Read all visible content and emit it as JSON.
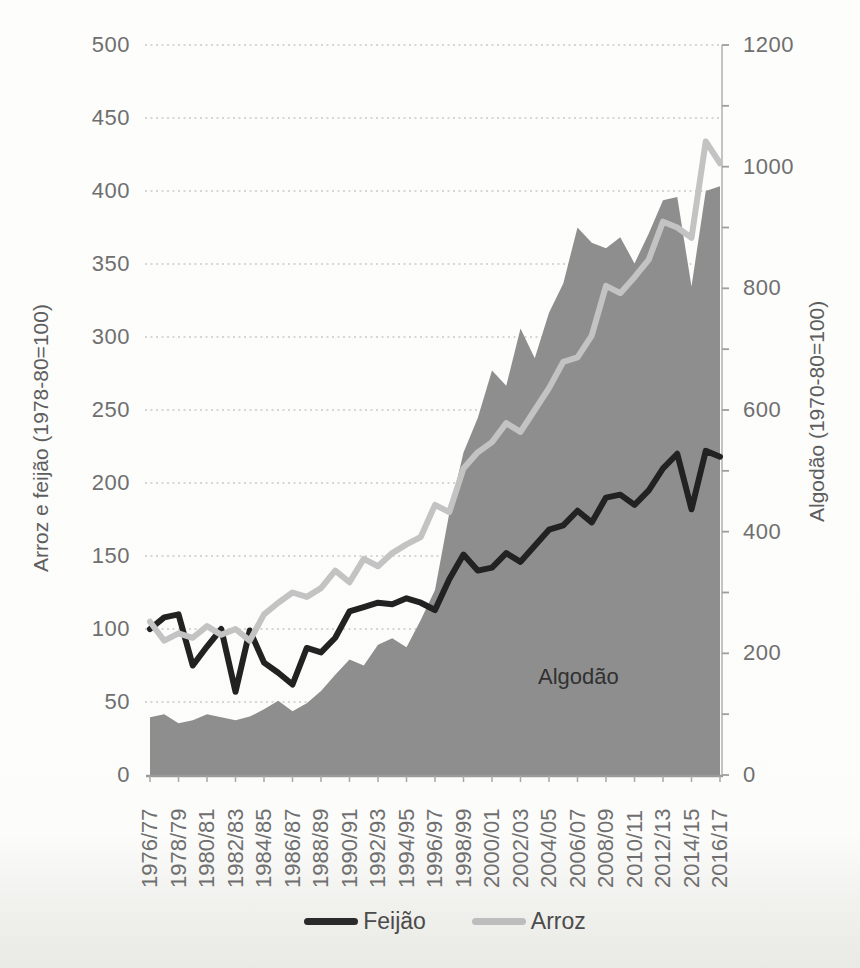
{
  "chart_data": {
    "type": "line",
    "subtype": "combo-area-and-lines",
    "grid": "horizontal-dotted",
    "legend_position": "bottom",
    "area_label": "Algodão",
    "categories": [
      "1976/77",
      "1977/78",
      "1978/79",
      "1979/80",
      "1980/81",
      "1981/82",
      "1982/83",
      "1983/84",
      "1984/85",
      "1985/86",
      "1986/87",
      "1987/88",
      "1988/89",
      "1989/90",
      "1990/91",
      "1991/92",
      "1992/93",
      "1993/94",
      "1994/95",
      "1995/96",
      "1996/97",
      "1997/98",
      "1998/99",
      "1999/00",
      "2000/01",
      "2001/02",
      "2002/03",
      "2003/04",
      "2004/05",
      "2005/06",
      "2006/07",
      "2007/08",
      "2008/09",
      "2009/10",
      "2010/11",
      "2011/12",
      "2012/13",
      "2013/14",
      "2014/15",
      "2015/16",
      "2016/17"
    ],
    "x_tick_labels": [
      "1976/77",
      "1978/79",
      "1980/81",
      "1982/83",
      "1984/85",
      "1986/87",
      "1988/89",
      "1990/91",
      "1992/93",
      "1994/95",
      "1996/97",
      "1998/99",
      "2000/01",
      "2002/03",
      "2004/05",
      "2006/07",
      "2008/09",
      "2010/11",
      "2012/13",
      "2014/15",
      "2016/17"
    ],
    "left_axis": {
      "title": "Arroz e feijão (1978-80=100)",
      "min": 0,
      "max": 500,
      "tick_step": 50,
      "ticks": [
        0,
        50,
        100,
        150,
        200,
        250,
        300,
        350,
        400,
        450,
        500
      ]
    },
    "right_axis": {
      "title": "Algodão (1970-80=100)",
      "min": 0,
      "max": 1200,
      "tick_step": 200,
      "minor_tick_step": 100,
      "ticks": [
        0,
        200,
        400,
        600,
        800,
        1000,
        1200
      ]
    },
    "series": [
      {
        "name": "Algodão",
        "kind": "area",
        "axis": "right",
        "color": "#8e8e8e",
        "values": [
          95,
          100,
          85,
          90,
          100,
          95,
          90,
          96,
          108,
          122,
          105,
          118,
          138,
          165,
          190,
          180,
          214,
          225,
          210,
          255,
          304,
          430,
          530,
          587,
          665,
          640,
          734,
          685,
          760,
          808,
          900,
          875,
          866,
          884,
          841,
          890,
          945,
          950,
          803,
          960,
          968
        ]
      },
      {
        "name": "Feijão",
        "kind": "line",
        "axis": "left",
        "color": "#222222",
        "values": [
          100,
          108,
          110,
          75,
          88,
          100,
          57,
          99,
          77,
          70,
          62,
          87,
          84,
          94,
          112,
          115,
          118,
          117,
          121,
          118,
          113,
          134,
          151,
          140,
          142,
          152,
          146,
          157,
          168,
          171,
          181,
          173,
          190,
          192,
          185,
          195,
          210,
          220,
          182,
          222,
          218
        ]
      },
      {
        "name": "Arroz",
        "kind": "line",
        "axis": "left",
        "color": "#c3c3c3",
        "values": [
          105,
          92,
          97,
          94,
          102,
          96,
          100,
          92,
          110,
          118,
          125,
          122,
          128,
          140,
          132,
          148,
          143,
          152,
          158,
          163,
          185,
          180,
          210,
          221,
          228,
          241,
          235,
          250,
          265,
          283,
          286,
          301,
          335,
          330,
          341,
          353,
          379,
          375,
          368,
          434,
          419
        ]
      }
    ],
    "legend": [
      {
        "label": "Feijão",
        "color": "#2a2a2a"
      },
      {
        "label": "Arroz",
        "color": "#bdbdbd"
      }
    ]
  }
}
